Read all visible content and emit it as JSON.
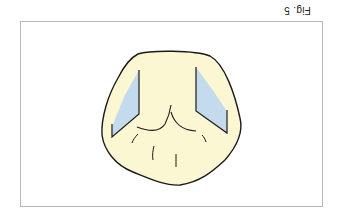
{
  "figure": {
    "caption": "Fig. 5",
    "orientation": "rotated-180",
    "colors": {
      "tooth_fill": "#fbf7d3",
      "facet_fill": "#c4dbee",
      "outline": "#1a1a1a",
      "frame_border": "#b8b8b8"
    }
  }
}
